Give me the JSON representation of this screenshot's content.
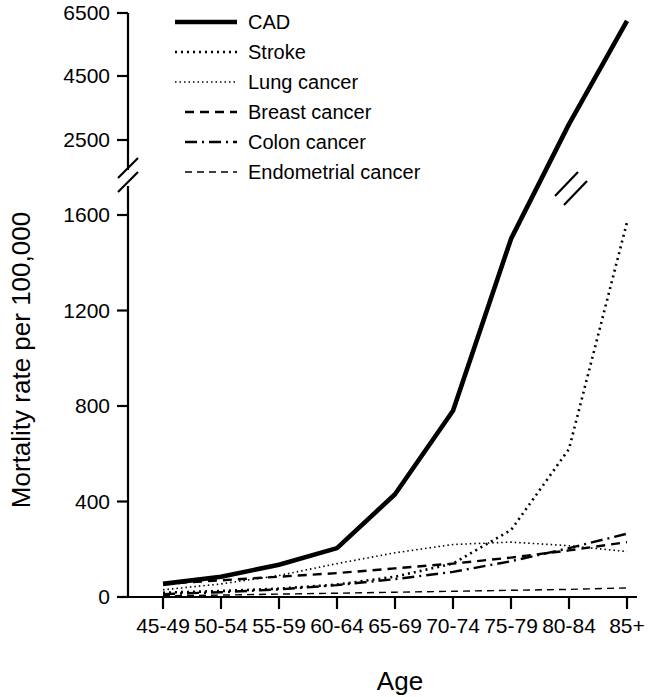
{
  "chart_data": {
    "type": "line",
    "title": "",
    "xlabel": "Age",
    "ylabel": "Mortality rate per 100,000",
    "categories": [
      "45-49",
      "50-54",
      "55-59",
      "60-64",
      "65-69",
      "70-74",
      "75-79",
      "80-84",
      "85+"
    ],
    "ytick_labels": [
      "0",
      "400",
      "800",
      "1200",
      "1600",
      "2500",
      "4500",
      "6500"
    ],
    "ytick_values": [
      0,
      400,
      800,
      1200,
      1600,
      2500,
      4500,
      6500
    ],
    "axis_break": {
      "present": true,
      "between": [
        1600,
        2500
      ],
      "axis": "y"
    },
    "ylim": [
      0,
      6500
    ],
    "grid": false,
    "legend_position": "top-left",
    "series": [
      {
        "name": "CAD",
        "style": "solid",
        "line_width": 4.6,
        "dash": "none",
        "values": [
          55,
          85,
          135,
          205,
          430,
          780,
          1500,
          3000,
          6250
        ]
      },
      {
        "name": "Stroke",
        "style": "dotted",
        "line_width": 2.6,
        "dash": "2,4",
        "values": [
          18,
          25,
          35,
          52,
          85,
          140,
          280,
          620,
          1570
        ]
      },
      {
        "name": "Lung cancer",
        "style": "fine-dotted",
        "line_width": 1.6,
        "dash": "1.5,3",
        "values": [
          30,
          55,
          90,
          140,
          185,
          220,
          230,
          215,
          190
        ]
      },
      {
        "name": "Breast cancer",
        "style": "dashed",
        "line_width": 2.4,
        "dash": "9,6",
        "values": [
          55,
          70,
          85,
          100,
          120,
          140,
          165,
          195,
          230
        ]
      },
      {
        "name": "Colon cancer",
        "style": "dash-dot",
        "line_width": 2.4,
        "dash": "12,5,2,5",
        "values": [
          12,
          20,
          32,
          50,
          75,
          105,
          150,
          205,
          265
        ]
      },
      {
        "name": "Endometrial cancer",
        "style": "thin-dashed",
        "line_width": 1.4,
        "dash": "7,5",
        "values": [
          5,
          8,
          12,
          16,
          20,
          24,
          28,
          32,
          38
        ]
      }
    ]
  },
  "legend": {
    "items": [
      {
        "label": "CAD"
      },
      {
        "label": "Stroke"
      },
      {
        "label": "Lung cancer"
      },
      {
        "label": "Breast cancer"
      },
      {
        "label": "Colon cancer"
      },
      {
        "label": "Endometrial cancer"
      }
    ]
  }
}
